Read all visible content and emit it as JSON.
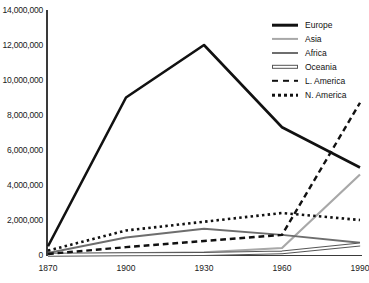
{
  "chart_data": {
    "type": "line",
    "title": "",
    "xlabel": "",
    "ylabel": "",
    "x": [
      1870,
      1900,
      1930,
      1960,
      1990
    ],
    "tick_labels": {
      "x": [
        "1870",
        "1900",
        "1930",
        "1960",
        "1990"
      ],
      "y": [
        "0",
        "2,000,000",
        "4,000,000",
        "6,000,000",
        "8,000,000",
        "10,000,000",
        "12,000,000",
        "14,000,000"
      ]
    },
    "ylim": [
      0,
      14000000
    ],
    "y_step": 2000000,
    "grid": false,
    "legend_position": "top-right",
    "series": [
      {
        "name": "Europe",
        "style": "solid",
        "color": "#111111",
        "width": 2.6,
        "values": [
          500000,
          9000000,
          12000000,
          7300000,
          5000000
        ]
      },
      {
        "name": "Asia",
        "style": "solid",
        "color": "#a8a8a8",
        "width": 2.2,
        "values": [
          40000,
          90000,
          150000,
          400000,
          4600000
        ]
      },
      {
        "name": "Africa",
        "style": "solid",
        "color": "#6e6e6e",
        "width": 2.0,
        "values": [
          120000,
          1000000,
          1500000,
          1150000,
          700000
        ]
      },
      {
        "name": "Oceania",
        "style": "outline",
        "color": "#ffffff",
        "width": 2.0,
        "values": [
          20000,
          40000,
          60000,
          150000,
          600000
        ]
      },
      {
        "name": "L. America",
        "style": "dashed",
        "color": "#111111",
        "width": 2.4,
        "values": [
          60000,
          450000,
          800000,
          1150000,
          8700000
        ]
      },
      {
        "name": "N. America",
        "style": "dotted",
        "color": "#111111",
        "width": 2.6,
        "values": [
          250000,
          1400000,
          1900000,
          2400000,
          2000000
        ]
      }
    ]
  },
  "legend": {
    "items": [
      {
        "label": "Europe"
      },
      {
        "label": "Asia"
      },
      {
        "label": "Africa"
      },
      {
        "label": "Oceania"
      },
      {
        "label": "L. America"
      },
      {
        "label": "N. America"
      }
    ]
  }
}
